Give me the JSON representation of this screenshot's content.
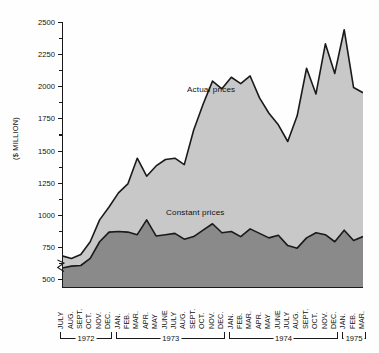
{
  "chart_data": {
    "type": "area",
    "title": "",
    "subtitle": "",
    "xlabel": "",
    "ylabel": "($ MILLION)",
    "ylim": [
      430,
      2500
    ],
    "yticks": [
      500,
      750,
      1000,
      1250,
      1500,
      1750,
      2000,
      2250,
      2500
    ],
    "ytick_labels": [
      "500",
      "750",
      "1000",
      "1250",
      "1500",
      "1750",
      "2000",
      "2250",
      "2500"
    ],
    "grid": false,
    "axis_break_below": 500,
    "legend_position": "inline-annotation",
    "annotations": [
      {
        "text": "Actual prices",
        "series": "Actual prices"
      },
      {
        "text": "Constant prices",
        "series": "Constant prices"
      }
    ],
    "categories": [
      "JULY",
      "AUG.",
      "SEPT.",
      "OCT.",
      "NOV.",
      "DEC.",
      "JAN.",
      "FEB.",
      "MAR.",
      "APR.",
      "MAY",
      "JUNE",
      "JULY",
      "AUG.",
      "SEPT.",
      "OCT.",
      "NOV.",
      "DEC.",
      "JAN.",
      "FEB.",
      "MAR.",
      "APR.",
      "MAY",
      "JUNE",
      "JULY",
      "AUG.",
      "SEPT.",
      "OCT.",
      "NOV.",
      "DEC.",
      "JAN.",
      "FEB.",
      "MAR."
    ],
    "year_groups": [
      {
        "label": "1972",
        "start_index": 0,
        "end_index": 5
      },
      {
        "label": "1973",
        "start_index": 6,
        "end_index": 17
      },
      {
        "label": "1974",
        "start_index": 18,
        "end_index": 29
      },
      {
        "label": "1975",
        "start_index": 30,
        "end_index": 32
      }
    ],
    "series": [
      {
        "name": "Actual prices",
        "color": "#c8c8c8",
        "line_color": "#1a1a1a",
        "values": [
          680,
          660,
          690,
          790,
          960,
          1060,
          1170,
          1240,
          1440,
          1300,
          1380,
          1430,
          1440,
          1390,
          1660,
          1860,
          2040,
          1980,
          2070,
          2020,
          2080,
          1910,
          1790,
          1700,
          1570,
          1770,
          2140,
          1940,
          2330,
          2100,
          2440,
          1990,
          1950
        ]
      },
      {
        "name": "Constant prices",
        "color": "#8a8a8a",
        "line_color": "#1a1a1a",
        "values": [
          585,
          600,
          605,
          660,
          790,
          865,
          870,
          865,
          845,
          960,
          835,
          845,
          855,
          810,
          830,
          880,
          930,
          860,
          870,
          830,
          890,
          855,
          820,
          840,
          760,
          740,
          820,
          860,
          845,
          790,
          880,
          800,
          830
        ]
      }
    ]
  }
}
